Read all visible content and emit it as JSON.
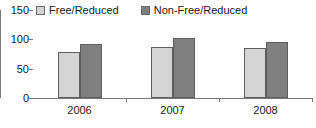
{
  "chart_data": {
    "type": "bar",
    "title": "",
    "subtitle": "",
    "xlabel": "",
    "ylabel": "",
    "categories": [
      "2006",
      "2007",
      "2008"
    ],
    "series": [
      {
        "name": "Free/Reduced",
        "values": [
          78,
          87,
          85
        ],
        "color": "#d4d4d4"
      },
      {
        "name": "Non-Free/Reduced",
        "values": [
          92,
          103,
          95
        ],
        "color": "#808080"
      }
    ],
    "ylim": [
      0,
      150
    ],
    "yticks": [
      0,
      50,
      100,
      150
    ],
    "ytick_labels": [
      "0",
      "50",
      "100",
      "150"
    ],
    "grid": false,
    "legend_position": "top-left",
    "orientation": "vertical",
    "grouped": true
  },
  "legend": {
    "entries": [
      {
        "label": "Free/Reduced",
        "swatch": "legend-swatch-light"
      },
      {
        "label": "Non-Free/Reduced",
        "swatch": "legend-swatch-dark"
      }
    ]
  },
  "axes": {
    "y_tick_labels": [
      "150",
      "100",
      "50",
      "0"
    ],
    "x_tick_labels": [
      "2006",
      "2007",
      "2008"
    ]
  },
  "colors": {
    "series_light": "#d4d4d4",
    "series_dark": "#808080",
    "axis": "#7a7a7a",
    "bar_outline": "#5e5e5e",
    "text": "#1a1a1a",
    "background": "#ffffff"
  }
}
